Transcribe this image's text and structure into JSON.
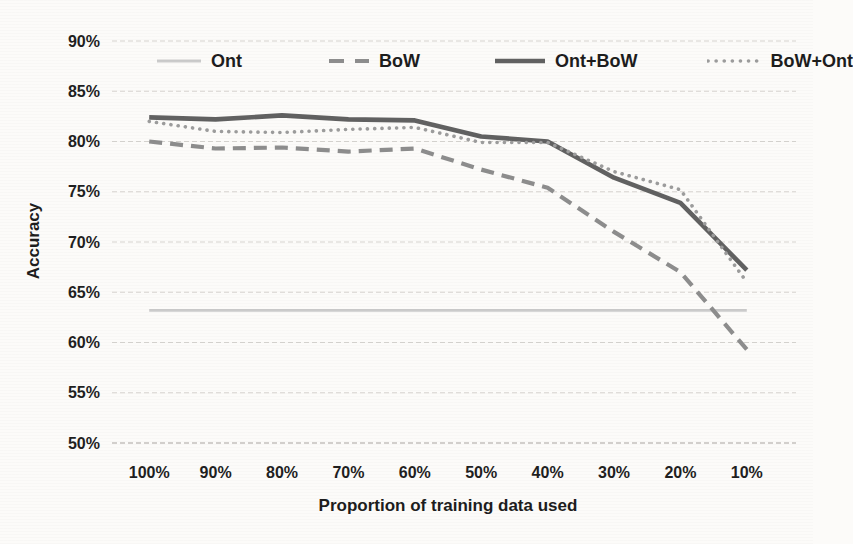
{
  "chart_data": {
    "type": "line",
    "title": "",
    "xlabel": "Proportion of training data used",
    "ylabel": "Accuracy",
    "categories": [
      "100%",
      "90%",
      "80%",
      "70%",
      "60%",
      "50%",
      "40%",
      "30%",
      "20%",
      "10%"
    ],
    "y_ticks": [
      "90%",
      "85%",
      "80%",
      "75%",
      "70%",
      "65%",
      "60%",
      "55%",
      "50%"
    ],
    "ylim": [
      50,
      90
    ],
    "grid": "horizontal-only",
    "legend_position": "top-inside",
    "background_color": "#fcfbf9",
    "gridline_color": "#d6d4d0",
    "text_color": "#1f1f1f",
    "series": [
      {
        "name": "Ont",
        "style": "solid-thin",
        "color": "#cbcbcb",
        "values": [
          63.2,
          63.2,
          63.2,
          63.2,
          63.2,
          63.2,
          63.2,
          63.2,
          63.2,
          63.2
        ]
      },
      {
        "name": "BoW",
        "style": "dashed",
        "color": "#8d8d8d",
        "values": [
          80.0,
          79.3,
          79.4,
          79.0,
          79.3,
          77.2,
          75.4,
          71.0,
          67.0,
          59.3
        ]
      },
      {
        "name": "Ont+BoW",
        "style": "solid-thick",
        "color": "#616161",
        "values": [
          82.4,
          82.2,
          82.6,
          82.2,
          82.1,
          80.5,
          80.0,
          76.4,
          73.9,
          67.2
        ]
      },
      {
        "name": "BoW+Ont",
        "style": "dotted",
        "color": "#9c9c9c",
        "values": [
          82.0,
          81.0,
          80.9,
          81.2,
          81.4,
          79.9,
          79.9,
          77.0,
          75.2,
          66.0
        ]
      }
    ]
  }
}
